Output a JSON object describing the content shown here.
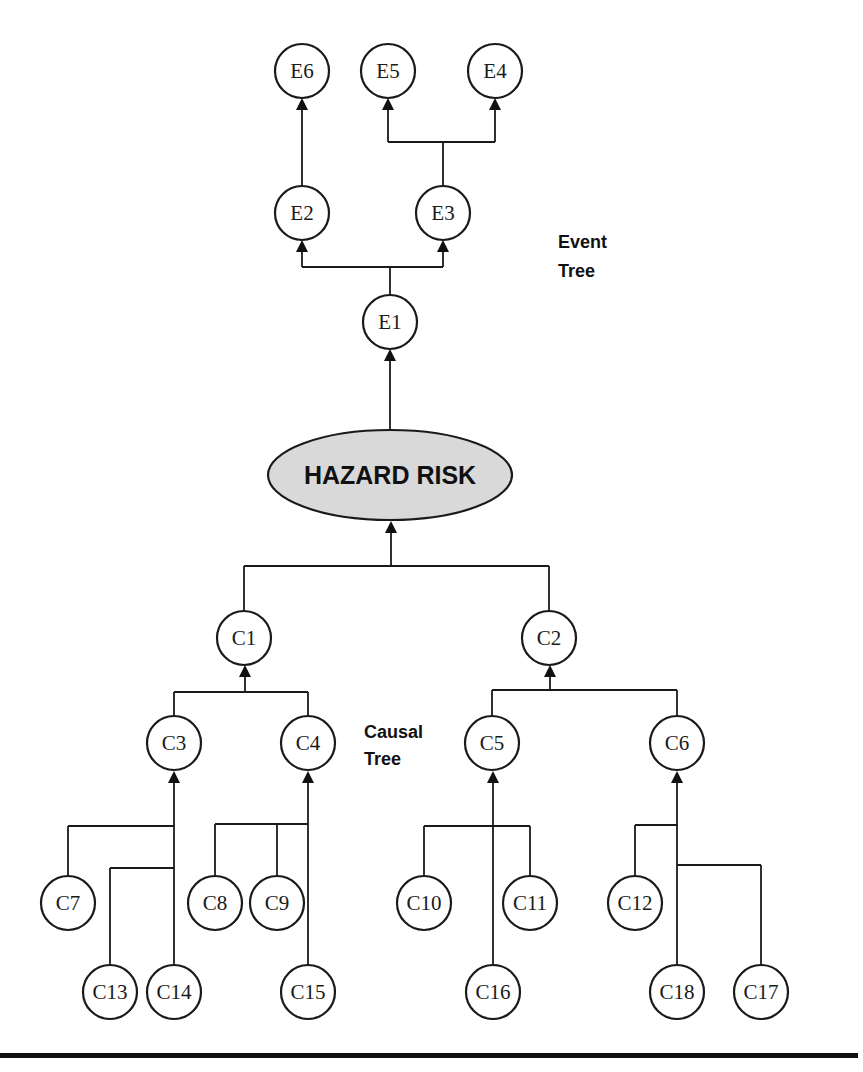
{
  "diagram": {
    "title": "",
    "center_node": {
      "id": "hazard",
      "label": "HAZARD RISK",
      "fill": "#d9d9d9"
    },
    "section_labels": {
      "event_tree": {
        "line1": "Event",
        "line2": "Tree"
      },
      "causal_tree": {
        "line1": "Causal",
        "line2": "Tree"
      }
    },
    "event_nodes": {
      "E1": "E1",
      "E2": "E2",
      "E3": "E3",
      "E4": "E4",
      "E5": "E5",
      "E6": "E6"
    },
    "causal_nodes": {
      "C1": "C1",
      "C2": "C2",
      "C3": "C3",
      "C4": "C4",
      "C5": "C5",
      "C6": "C6",
      "C7": "C7",
      "C8": "C8",
      "C9": "C9",
      "C10": "C10",
      "C11": "C11",
      "C12": "C12",
      "C13": "C13",
      "C14": "C14",
      "C15": "C15",
      "C16": "C16",
      "C17": "C17",
      "C18": "C18"
    },
    "edges": [
      {
        "from": "hazard",
        "to": "E1"
      },
      {
        "from": "E1",
        "to": "E2"
      },
      {
        "from": "E1",
        "to": "E3"
      },
      {
        "from": "E2",
        "to": "E6"
      },
      {
        "from": "E3",
        "to": "E5"
      },
      {
        "from": "E3",
        "to": "E4"
      },
      {
        "from": "C1",
        "to": "hazard"
      },
      {
        "from": "C2",
        "to": "hazard"
      },
      {
        "from": "C3",
        "to": "C1"
      },
      {
        "from": "C4",
        "to": "C1"
      },
      {
        "from": "C5",
        "to": "C2"
      },
      {
        "from": "C6",
        "to": "C2"
      },
      {
        "from": "C7",
        "to": "C3"
      },
      {
        "from": "C13",
        "to": "C3"
      },
      {
        "from": "C14",
        "to": "C3"
      },
      {
        "from": "C8",
        "to": "C4"
      },
      {
        "from": "C9",
        "to": "C4"
      },
      {
        "from": "C15",
        "to": "C4"
      },
      {
        "from": "C10",
        "to": "C5"
      },
      {
        "from": "C11",
        "to": "C5"
      },
      {
        "from": "C16",
        "to": "C5"
      },
      {
        "from": "C12",
        "to": "C6"
      },
      {
        "from": "C18",
        "to": "C6"
      },
      {
        "from": "C17",
        "to": "C6"
      }
    ],
    "colors": {
      "line": "#1a1a1a",
      "hazard_fill": "#d9d9d9",
      "background": "#ffffff"
    }
  }
}
